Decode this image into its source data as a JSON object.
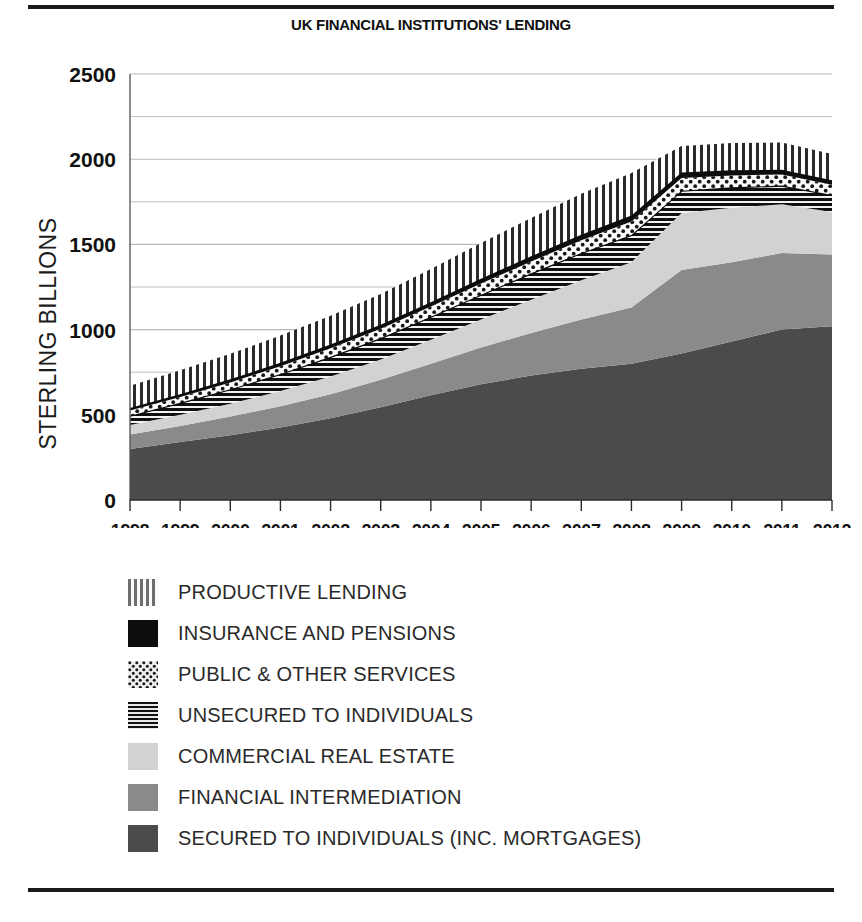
{
  "figure": {
    "title": "UK FINANCIAL INSTITUTIONS' LENDING",
    "ylabel": "STERLING BILLIONS"
  },
  "legend": {
    "items": [
      {
        "label": "PRODUCTIVE LENDING",
        "pattern": "vertical-stripes",
        "color": "#8c8c8c"
      },
      {
        "label": "INSURANCE AND PENSIONS",
        "pattern": "solid",
        "color": "#0d0d0d"
      },
      {
        "label": "PUBLIC & OTHER SERVICES",
        "pattern": "dots",
        "color": "#b5b5b5"
      },
      {
        "label": "UNSECURED TO INDIVIDUALS",
        "pattern": "horizontal-stripes",
        "color": "#1a1a1a"
      },
      {
        "label": "COMMERCIAL REAL ESTATE",
        "pattern": "solid",
        "color": "#d2d2d2"
      },
      {
        "label": "FINANCIAL INTERMEDIATION",
        "pattern": "solid",
        "color": "#8a8a8a"
      },
      {
        "label": "SECURED TO INDIVIDUALS (INC. MORTGAGES)",
        "pattern": "solid",
        "color": "#4b4b4b"
      }
    ]
  },
  "chart_data": {
    "type": "area",
    "stacked": true,
    "title": "UK FINANCIAL INSTITUTIONS' LENDING",
    "xlabel": "",
    "ylabel": "STERLING BILLIONS",
    "ylim": [
      0,
      2500
    ],
    "yticks": [
      0,
      500,
      1000,
      1500,
      2000,
      2500
    ],
    "gridlines": [
      500,
      750,
      1000,
      1250,
      1500,
      1750,
      2000,
      2250,
      2500
    ],
    "grid": true,
    "legend_position": "below",
    "categories": [
      1998,
      1999,
      2000,
      2001,
      2002,
      2003,
      2004,
      2005,
      2006,
      2007,
      2008,
      2009,
      2010,
      2011,
      2012
    ],
    "series": [
      {
        "name": "SECURED TO INDIVIDUALS (INC. MORTGAGES)",
        "values": [
          300,
          340,
          380,
          425,
          480,
          545,
          615,
          680,
          730,
          770,
          800,
          860,
          930,
          1000,
          1020
        ]
      },
      {
        "name": "FINANCIAL INTERMEDIATION",
        "values": [
          85,
          95,
          110,
          125,
          140,
          160,
          185,
          215,
          250,
          290,
          330,
          490,
          465,
          450,
          420
        ]
      },
      {
        "name": "COMMERCIAL REAL ESTATE",
        "values": [
          55,
          65,
          75,
          90,
          105,
          120,
          140,
          165,
          195,
          230,
          265,
          335,
          320,
          285,
          250
        ]
      },
      {
        "name": "UNSECURED TO INDIVIDUALS",
        "values": [
          55,
          70,
          85,
          100,
          115,
          125,
          135,
          145,
          155,
          160,
          160,
          130,
          120,
          110,
          100
        ]
      },
      {
        "name": "PUBLIC & OTHER SERVICES",
        "values": [
          30,
          35,
          40,
          45,
          50,
          55,
          60,
          65,
          70,
          75,
          80,
          75,
          70,
          65,
          60
        ]
      },
      {
        "name": "INSURANCE AND PENSIONS",
        "values": [
          15,
          16,
          18,
          20,
          22,
          24,
          26,
          28,
          30,
          32,
          34,
          32,
          30,
          28,
          26
        ]
      },
      {
        "name": "PRODUCTIVE LENDING",
        "values": [
          130,
          140,
          150,
          160,
          170,
          180,
          195,
          210,
          225,
          240,
          250,
          155,
          160,
          160,
          155
        ]
      }
    ],
    "totals": [
      670,
      761,
      858,
      965,
      1082,
      1209,
      1356,
      1508,
      1655,
      1797,
      1919,
      2077,
      2095,
      2098,
      2031
    ]
  }
}
